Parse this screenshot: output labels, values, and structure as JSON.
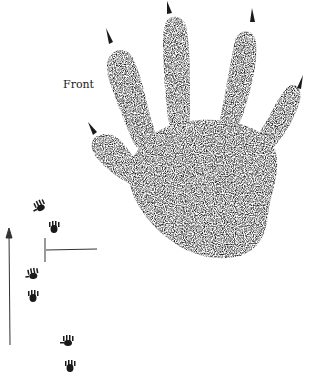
{
  "illustration": {
    "subject": "front-foot-track",
    "label": "Front",
    "ink_color": "#1a1a1a",
    "background": "#ffffff"
  },
  "trail": {
    "direction": "up",
    "prints_count": 6
  }
}
